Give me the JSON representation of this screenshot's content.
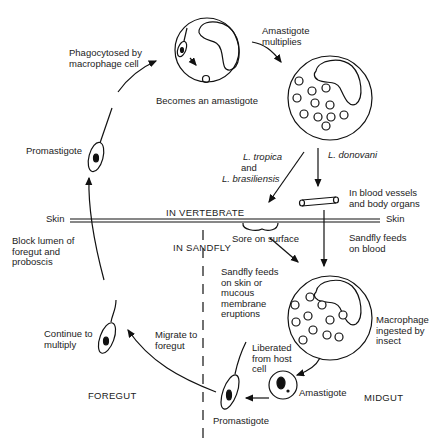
{
  "diagram": {
    "type": "life-cycle",
    "regions": {
      "vertebrate": "IN VERTEBRATE",
      "sandfly": "IN SANDFLY",
      "foregut": "FOREGUT",
      "midgut": "MIDGUT"
    },
    "skin_left": "Skin",
    "skin_right": "Skin",
    "labels": {
      "phagocytosed": "Phagocytosed by\nmacrophage cell",
      "becomes_amastigote": "Becomes an amastigote",
      "amastigote_multiplies": "Amastigote\nmultiplies",
      "promastigote_top": "Promastigote",
      "l_tropica": "L. tropica",
      "and": "and",
      "l_brasiliensis": "L. brasiliensis",
      "l_donovani": "L. donovani",
      "blood_vessels": "In blood vessels\nand body organs",
      "sore": "Sore on surface",
      "sandfly_feeds_blood": "Sandfly feeds\non blood",
      "block_lumen": "Block lumen of\nforegut and\nproboscis",
      "sandfly_feeds_skin": "Sandfly feeds\non skin or\nmucous\nmembrane\neruptions",
      "macrophage_ingested": "Macrophage\ningested by\ninsect",
      "continue_multiply": "Continue to\nmultiply",
      "migrate_foregut": "Migrate to\nforegut",
      "liberated": "Liberated\nfrom host\ncell",
      "amastigote": "Amastigote",
      "promastigote_bottom": "Promastigote"
    }
  }
}
